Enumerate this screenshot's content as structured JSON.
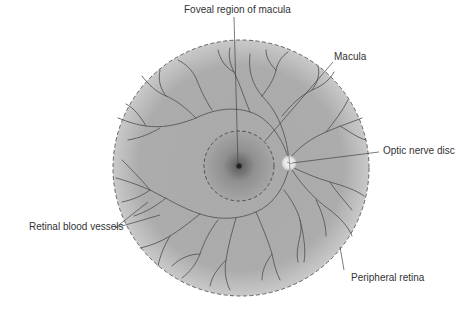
{
  "diagram": {
    "labels": {
      "fovea": "Foveal region of macula",
      "macula": "Macula",
      "optic_disc": "Optic nerve disc",
      "vessels": "Retinal blood vessels",
      "peripheral": "Peripheral retina"
    },
    "colors": {
      "retina_fill": "#a8a8a8",
      "retina_edge": "#cfcfcf",
      "vessel": "#555555",
      "dashed_outline": "#444444",
      "fovea_center": "#333333",
      "optic_disc": "#eeeeee",
      "leader_line": "#444444",
      "text": "#333333"
    }
  }
}
